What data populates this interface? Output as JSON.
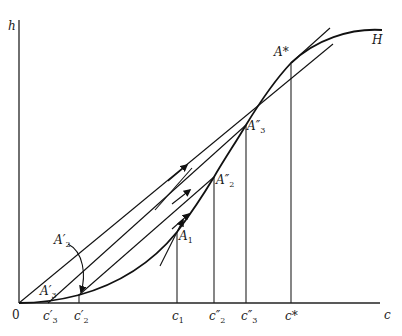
{
  "diagram": {
    "axes": {
      "y_label": "h",
      "x_label": "c",
      "origin_label": "0"
    },
    "curve_label": "H",
    "points": {
      "A_star": "A*",
      "A3_dprime": "A″",
      "A3_dprime_sub": "3",
      "A2_dprime": "A″",
      "A2_dprime_sub": "2",
      "A1": "A",
      "A1_sub": "1",
      "A2_prime": "A′",
      "A2_prime_sub": "2",
      "A3_prime": "A′",
      "A3_prime_sub": "3"
    },
    "x_ticks": {
      "c3_prime": "c′",
      "c3_prime_sub": "3",
      "c2_prime": "c′",
      "c2_prime_sub": "2",
      "c1": "c",
      "c1_sub": "1",
      "c2_dprime": "c″",
      "c2_dprime_sub": "2",
      "c3_dprime": "c″",
      "c3_dprime_sub": "3",
      "c_star": "c*"
    }
  }
}
